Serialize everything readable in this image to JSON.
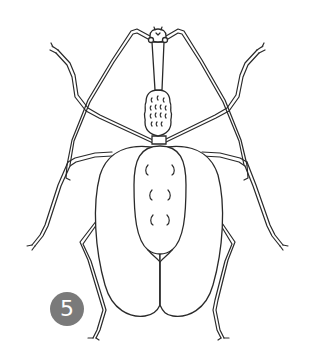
{
  "illustration": {
    "subject": "beetle line drawing",
    "style": "black ink line art on white",
    "background_color": "#ffffff",
    "line_color": "#2a2a2a"
  },
  "badge": {
    "number": "5",
    "color": "#7a7a7a",
    "text_color": "#ffffff"
  }
}
